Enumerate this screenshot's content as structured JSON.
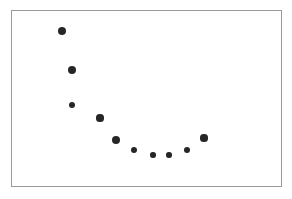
{
  "figure": {
    "name": "scatter-plot-figure",
    "width": 292,
    "height": 199,
    "background_color": "#ffffff"
  },
  "frame": {
    "name": "plot-frame",
    "x": 11,
    "y": 10,
    "width": 271,
    "height": 177,
    "border_color": "#9a9a9a",
    "border_width": 1,
    "fill_color": "#ffffff"
  },
  "style": {
    "marker_color": "#262626",
    "marker_shape": "circle"
  },
  "chart_data": {
    "type": "scatter",
    "title": "",
    "subtitle": "",
    "xlabel": "",
    "ylabel": "",
    "grid": false,
    "legend": null,
    "legend_position": "none",
    "axis_ticks": [],
    "xlim": [
      0,
      11
    ],
    "ylim": [
      0,
      10
    ],
    "marker_color": "#262626",
    "series": [
      {
        "name": "series-1",
        "x": [
          1,
          2,
          3,
          4,
          5,
          6,
          7,
          8,
          9,
          10
        ],
        "y": [
          8.82,
          6.5,
          4.35,
          3.63,
          2.26,
          1.67,
          1.43,
          1.43,
          1.73,
          2.44
        ],
        "pixel_points": [
          {
            "cx": 62,
            "cy": 31,
            "r": 4.2
          },
          {
            "cx": 72,
            "cy": 70,
            "r": 4.2
          },
          {
            "cx": 72,
            "cy": 105,
            "r": 3.2
          },
          {
            "cx": 100,
            "cy": 118,
            "r": 3.6
          },
          {
            "cx": 116,
            "cy": 140,
            "r": 4.0
          },
          {
            "cx": 134,
            "cy": 150,
            "r": 3.2
          },
          {
            "cx": 153,
            "cy": 155,
            "r": 2.7
          },
          {
            "cx": 169,
            "cy": 155,
            "r": 2.7
          },
          {
            "cx": 187,
            "cy": 150,
            "r": 3.0
          },
          {
            "cx": 204,
            "cy": 138,
            "r": 3.6
          }
        ]
      }
    ]
  }
}
